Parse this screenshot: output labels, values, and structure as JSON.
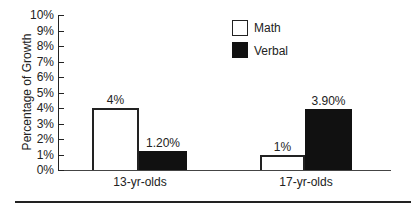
{
  "chart_data": {
    "type": "bar",
    "title": "",
    "xlabel": "",
    "ylabel": "Percentage of Growth",
    "ylim": [
      0,
      10
    ],
    "yticks": [
      "0%",
      "1%",
      "2%",
      "3%",
      "4%",
      "5%",
      "6%",
      "7%",
      "8%",
      "9%",
      "10%"
    ],
    "categories": [
      "13-yr-olds",
      "17-yr-olds"
    ],
    "series": [
      {
        "name": "Math",
        "values": [
          4,
          1
        ],
        "labels": [
          "4%",
          "1%"
        ],
        "color": "#ffffff"
      },
      {
        "name": "Verbal",
        "values": [
          1.2,
          3.9
        ],
        "labels": [
          "1.20%",
          "3.90%"
        ],
        "color": "#111111"
      }
    ],
    "legend_position": "upper-center-right",
    "grid": false
  }
}
